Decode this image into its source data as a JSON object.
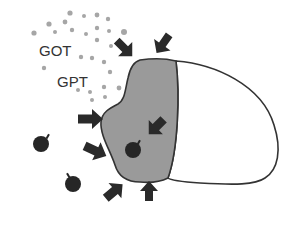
{
  "diagram": {
    "labels": {
      "got": "GOT",
      "gpt": "GPT"
    },
    "colors": {
      "background": "#ffffff",
      "damaged_region": "#9a9a9a",
      "healthy_region": "#ffffff",
      "outline": "#333333",
      "arrow": "#2a2a2a",
      "enzyme_dot": "#a6a6a6",
      "particle": "#262626"
    },
    "elements": {
      "cell": "cell-outline",
      "damaged_region": "grey damaged area",
      "healthy_region": "white intact area",
      "arrows_count": 7,
      "particles_count": 3,
      "enzyme_dots_count": 26
    }
  }
}
